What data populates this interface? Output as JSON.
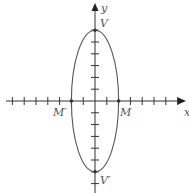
{
  "diagram": {
    "type": "ellipse-on-coordinate-axes",
    "axes": {
      "x_label": "x",
      "y_label": "y",
      "origin_px": [
        95,
        101
      ],
      "unit_px": 11.8,
      "x_ticks": [
        -7,
        -6,
        -5,
        -4,
        -3,
        -2,
        -1,
        1,
        2,
        3,
        4,
        5,
        6,
        7
      ],
      "y_ticks": [
        -7,
        -6,
        -5,
        -4,
        -3,
        -2,
        -1,
        1,
        2,
        3,
        4,
        5,
        6
      ]
    },
    "ellipse": {
      "center": [
        0,
        0
      ],
      "semi_major_y": 6,
      "semi_minor_x": 2
    },
    "points": [
      {
        "label": "V",
        "coords": [
          0,
          6
        ]
      },
      {
        "label": "V′",
        "coords": [
          0,
          -6
        ]
      },
      {
        "label": "M",
        "coords": [
          2,
          0
        ]
      },
      {
        "label": "M′",
        "coords": [
          -2,
          0
        ]
      }
    ],
    "colors": {
      "axis": "#333333",
      "curve": "#555555",
      "label": "#555555"
    }
  }
}
